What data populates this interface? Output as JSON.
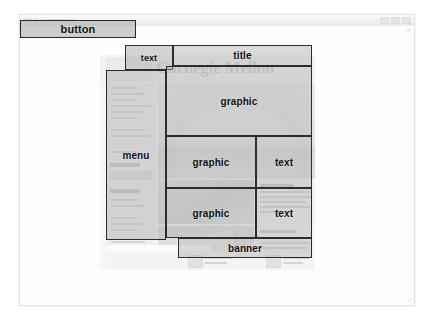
{
  "window": {
    "title": "Web Page Segmentation",
    "controls": [
      "minimize",
      "maximize",
      "close"
    ]
  },
  "toolbar": {
    "button_label": "button"
  },
  "diagram": {
    "regions": [
      {
        "id": "text-top",
        "label": "text",
        "role": "text"
      },
      {
        "id": "title",
        "label": "title",
        "role": "title"
      },
      {
        "id": "menu",
        "label": "menu",
        "role": "menu"
      },
      {
        "id": "graphic-top",
        "label": "graphic",
        "role": "graphic"
      },
      {
        "id": "graphic-mid",
        "label": "graphic",
        "role": "graphic"
      },
      {
        "id": "text-mid",
        "label": "text",
        "role": "text"
      },
      {
        "id": "graphic-low",
        "label": "graphic",
        "role": "graphic"
      },
      {
        "id": "text-low",
        "label": "text",
        "role": "text"
      },
      {
        "id": "banner",
        "label": "banner",
        "role": "banner"
      }
    ]
  },
  "background_page": {
    "wordmark": "Carnegie Mellon",
    "wordmark_color": "#a9a9a9"
  },
  "colors": {
    "annotation_fill": "#b0b0b0",
    "annotation_border": "#2c2c2c",
    "window_chrome": "#ececec",
    "page_background": "#ffffff"
  }
}
